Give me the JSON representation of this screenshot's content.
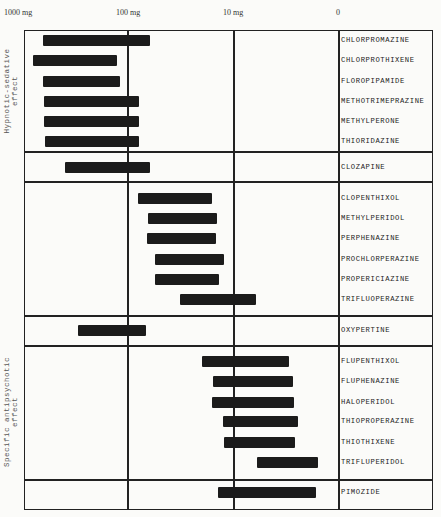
{
  "chart_data": {
    "type": "bar",
    "orientation": "horizontal-range",
    "title": "",
    "xlabel": "Daily dose (log scale)",
    "x_scale": "log",
    "x_ticks": [
      "1000 mg",
      "100 mg",
      "10 mg",
      "0"
    ],
    "x_tick_px": [
      24,
      128,
      234,
      339
    ],
    "grid": true,
    "groups": [
      {
        "name": "Hypnotic-sedative effect",
        "rows": [
          0,
          1,
          2,
          3,
          4,
          5
        ]
      },
      {
        "name": "Specific antipsychotic effect",
        "rows": [
          14,
          15,
          16,
          17,
          18,
          19
        ]
      }
    ],
    "categories": [
      "CHLORPROMAZINE",
      "CHLORPROTHIXENE",
      "FLOROPIPAMIDE",
      "METHOTRIMEPRAZINE",
      "METHYLPERONE",
      "THIORIDAZINE",
      "CLOZAPINE",
      "CLOPENTHIXOL",
      "METHYLPERIDOL",
      "PERPHENAZINE",
      "PROCHLORPERAZINE",
      "PROPERICIAZINE",
      "TRIFLUOPERAZINE",
      "OXYPERTINE",
      "FLUPENTHIXOL",
      "FLUPHENAZINE",
      "HALOPERIDOL",
      "THIOPROPERAZINE",
      "THIOTHIXENE",
      "TRIFLUPERIDOL",
      "PIMOZIDE"
    ],
    "series": [
      {
        "name": "dose range high (mg)",
        "values": [
          660,
          830,
          660,
          640,
          640,
          620,
          400,
          80,
          65,
          65,
          55,
          55,
          32,
          230,
          20,
          16,
          16,
          13,
          13,
          6,
          14
        ]
      },
      {
        "name": "dose range low (mg)",
        "values": [
          63,
          160,
          150,
          100,
          100,
          100,
          63,
          12,
          10,
          10,
          8.5,
          9.5,
          5,
          85,
          3.1,
          2.8,
          2.7,
          2.5,
          2.6,
          1.7,
          1.8
        ]
      }
    ]
  },
  "axis": {
    "t1000": "1000 mg",
    "t100": "100 mg",
    "t10": "10 mg",
    "t0": "0"
  },
  "groups": {
    "hypnotic": {
      "line1": "Hypnotic-sedative",
      "line2": "effect"
    },
    "specific": {
      "line1": "Specific antipsychotic",
      "line2": "effect"
    }
  },
  "rows": [
    {
      "name": "CHLORPROMAZINE",
      "x1": 43,
      "x2": 150,
      "y": 35
    },
    {
      "name": "CHLORPROTHIXENE",
      "x1": 33,
      "x2": 117,
      "y": 55
    },
    {
      "name": "FLOROPIPAMIDE",
      "x1": 43,
      "x2": 120,
      "y": 76
    },
    {
      "name": "METHOTRIMEPRAZINE",
      "x1": 44,
      "x2": 139,
      "y": 96
    },
    {
      "name": "METHYLPERONE",
      "x1": 44,
      "x2": 139,
      "y": 116
    },
    {
      "name": "THIORIDAZINE",
      "x1": 45,
      "x2": 139,
      "y": 136
    },
    {
      "name": "CLOZAPINE",
      "x1": 65,
      "x2": 150,
      "y": 162
    },
    {
      "name": "CLOPENTHIXOL",
      "x1": 138,
      "x2": 212,
      "y": 193
    },
    {
      "name": "METHYLPERIDOL",
      "x1": 148,
      "x2": 217,
      "y": 213
    },
    {
      "name": "PERPHENAZINE",
      "x1": 147,
      "x2": 216,
      "y": 233
    },
    {
      "name": "PROCHLORPERAZINE",
      "x1": 155,
      "x2": 224,
      "y": 254
    },
    {
      "name": "PROPERICIAZINE",
      "x1": 155,
      "x2": 219,
      "y": 274
    },
    {
      "name": "TRIFLUOPERAZINE",
      "x1": 180,
      "x2": 256,
      "y": 294
    },
    {
      "name": "OXYPERTINE",
      "x1": 78,
      "x2": 146,
      "y": 325
    },
    {
      "name": "FLUPENTHIXOL",
      "x1": 202,
      "x2": 289,
      "y": 356
    },
    {
      "name": "FLUPHENAZINE",
      "x1": 213,
      "x2": 293,
      "y": 376
    },
    {
      "name": "HALOPERIDOL",
      "x1": 212,
      "x2": 294,
      "y": 397
    },
    {
      "name": "THIOPROPERAZINE",
      "x1": 223,
      "x2": 298,
      "y": 416
    },
    {
      "name": "THIOTHIXENE",
      "x1": 224,
      "x2": 295,
      "y": 437
    },
    {
      "name": "TRIFLUPERIDOL",
      "x1": 257,
      "x2": 318,
      "y": 457
    },
    {
      "name": "PIMOZIDE",
      "x1": 218,
      "x2": 316,
      "y": 487
    }
  ]
}
